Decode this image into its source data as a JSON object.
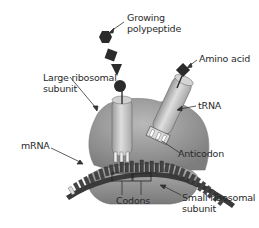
{
  "labels": {
    "growing_polypeptide": [
      "Growing",
      "polypeptide"
    ],
    "amino_acid": "Amino acid",
    "large_subunit": [
      "Large ribosomal",
      "subunit"
    ],
    "trna": "tRNA",
    "mrna": "mRNA",
    "anticodon": "Anticodon",
    "codons": "Codons",
    "small_subunit": [
      "Small ribosomal",
      "subunit"
    ]
  },
  "colors": {
    "subunit_fill": "#8c8c8c",
    "subunit_light": "#b5b5b5",
    "trna_fill": "#c8c8c8",
    "mrna_dark": "#3a3a3a",
    "residue": "#2b2b2b",
    "text": "#2a2a2a",
    "leader": "#333333"
  }
}
